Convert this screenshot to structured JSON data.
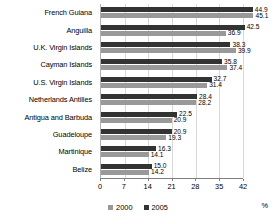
{
  "chart_data": {
    "type": "bar",
    "orientation": "horizontal",
    "title": "",
    "xlabel": "%",
    "ylabel": "",
    "xlim": [
      0,
      42
    ],
    "xticks": [
      "0",
      "7",
      "14",
      "21",
      "28",
      "35",
      "42"
    ],
    "grid": true,
    "legend_position": "bottom",
    "categories": [
      "French Guiana",
      "Anguilla",
      "U.K. Virgin Islands",
      "Cayman Islands",
      "U.S. Virgin Islands",
      "Netherlands Antilles",
      "Antigua and Barbuda",
      "Guadeloupe",
      "Martinique",
      "Belize"
    ],
    "series": [
      {
        "name": "2005",
        "color": "#333333",
        "values": [
          44.9,
          42.5,
          38.3,
          35.8,
          32.7,
          28.4,
          22.5,
          20.9,
          16.3,
          15.0
        ]
      },
      {
        "name": "2000",
        "color": "#999999",
        "values": [
          45.1,
          36.9,
          39.9,
          37.4,
          31.4,
          28.2,
          20.9,
          19.3,
          14.1,
          14.2
        ]
      }
    ]
  },
  "legend": {
    "items": [
      {
        "label": "2000",
        "series": "s2000"
      },
      {
        "label": "2005",
        "series": "s2005"
      }
    ]
  },
  "axis": {
    "unit_label": "%"
  }
}
